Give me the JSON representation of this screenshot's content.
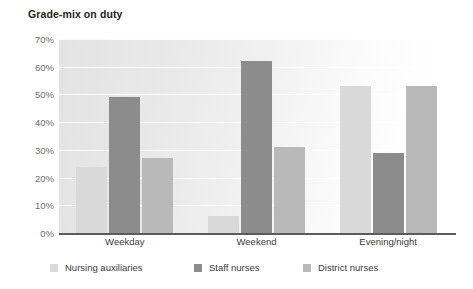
{
  "chart_data": {
    "type": "bar",
    "title": "Grade-mix on duty",
    "xlabel": "",
    "ylabel": "",
    "ylim": [
      0,
      70
    ],
    "grid": true,
    "legend_position": "bottom",
    "categories": [
      "Weekday",
      "Weekend",
      "Evening/night"
    ],
    "ytick_labels": [
      "0%",
      "10%",
      "20%",
      "30%",
      "40%",
      "50%",
      "60%",
      "70%"
    ],
    "ytick_values": [
      0,
      10,
      20,
      30,
      40,
      50,
      60,
      70
    ],
    "series": [
      {
        "name": "Nursing auxiliaries",
        "color": "#d9d9d9",
        "values": [
          24,
          6,
          53
        ]
      },
      {
        "name": "Staff nurses",
        "color": "#8c8c8c",
        "values": [
          49,
          62,
          29
        ]
      },
      {
        "name": "District nurses",
        "color": "#b9b9b9",
        "values": [
          27,
          31,
          53
        ]
      }
    ]
  }
}
